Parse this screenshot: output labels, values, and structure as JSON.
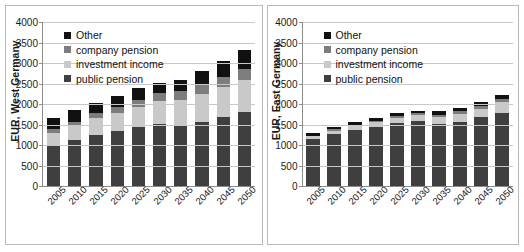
{
  "figure": {
    "background": "#ffffff",
    "panel_border": "#b9b9b9"
  },
  "colors": {
    "public_pension": "#3f3f3f",
    "investment_income": "#c9c9c9",
    "company_pension": "#7d7d7d",
    "other": "#111111",
    "axis": "#8c8c8c",
    "gridline": "#c8c8c8"
  },
  "legend": {
    "items": [
      {
        "key": "other",
        "label": "Other",
        "color": "#111111"
      },
      {
        "key": "company_pension",
        "label": "company pension",
        "color": "#7d7d7d"
      },
      {
        "key": "investment_income",
        "label": "investment income",
        "color": "#c9c9c9"
      },
      {
        "key": "public_pension",
        "label": "public pension",
        "color": "#3f3f3f"
      }
    ]
  },
  "chart_data": [
    {
      "id": "west-germany",
      "type": "bar",
      "stacked": true,
      "title": "",
      "xlabel": "",
      "ylabel": "EUR, West Germany",
      "ylim": [
        0,
        4000
      ],
      "yticks": [
        0,
        500,
        1000,
        1500,
        2000,
        2500,
        3000,
        3500,
        4000
      ],
      "ytick_labels": [
        "0",
        "500",
        "1000",
        "1500",
        "2000",
        "2500",
        "3000",
        "3500",
        "4000"
      ],
      "grid": true,
      "legend_position": "upper left",
      "categories": [
        "2005",
        "2010",
        "2015",
        "2020",
        "2025",
        "2030",
        "2035",
        "2040",
        "2045",
        "2050"
      ],
      "series": [
        {
          "name": "public pension",
          "color": "#3f3f3f",
          "values": [
            1010,
            1130,
            1250,
            1330,
            1440,
            1510,
            1470,
            1570,
            1690,
            1800
          ]
        },
        {
          "name": "investment income",
          "color": "#c9c9c9",
          "values": [
            290,
            330,
            400,
            440,
            490,
            570,
            630,
            680,
            720,
            790
          ]
        },
        {
          "name": "company pension",
          "color": "#7d7d7d",
          "values": [
            90,
            100,
            120,
            150,
            180,
            200,
            220,
            240,
            250,
            270
          ]
        },
        {
          "name": "Other",
          "color": "#111111",
          "values": [
            260,
            290,
            250,
            270,
            270,
            240,
            270,
            320,
            390,
            450
          ]
        }
      ],
      "totals": [
        1650,
        1850,
        2020,
        2190,
        2380,
        2520,
        2590,
        2810,
        3050,
        3310
      ]
    },
    {
      "id": "east-germany",
      "type": "bar",
      "stacked": true,
      "title": "",
      "xlabel": "",
      "ylabel": "EUR, East Germany",
      "ylim": [
        0,
        4000
      ],
      "yticks": [
        0,
        500,
        1000,
        1500,
        2000,
        2500,
        3000,
        3500,
        4000
      ],
      "ytick_labels": [
        "0",
        "500",
        "1000",
        "1500",
        "2000",
        "2500",
        "3000",
        "3500",
        "4000"
      ],
      "grid": true,
      "legend_position": "upper left",
      "categories": [
        "2005",
        "2010",
        "2015",
        "2020",
        "2025",
        "2030",
        "2035",
        "2040",
        "2045",
        "2050"
      ],
      "series": [
        {
          "name": "public pension",
          "color": "#3f3f3f",
          "values": [
            1150,
            1270,
            1370,
            1440,
            1530,
            1580,
            1520,
            1570,
            1680,
            1790
          ]
        },
        {
          "name": "investment income",
          "color": "#c9c9c9",
          "values": [
            60,
            80,
            100,
            120,
            140,
            150,
            170,
            190,
            210,
            250
          ]
        },
        {
          "name": "company pension",
          "color": "#7d7d7d",
          "values": [
            20,
            30,
            30,
            30,
            40,
            40,
            50,
            60,
            70,
            80
          ]
        },
        {
          "name": "Other",
          "color": "#111111",
          "values": [
            60,
            70,
            70,
            70,
            70,
            70,
            80,
            90,
            90,
            90
          ]
        }
      ],
      "totals": [
        1290,
        1450,
        1570,
        1660,
        1780,
        1840,
        1820,
        1910,
        2050,
        2210
      ]
    }
  ]
}
